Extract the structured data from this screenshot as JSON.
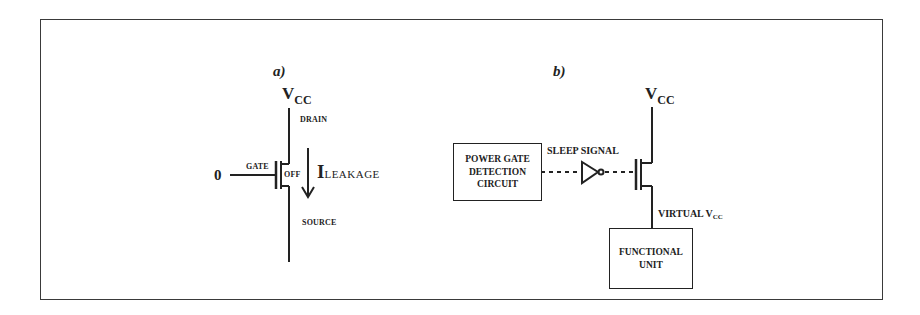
{
  "figure": {
    "panel_a": {
      "label": "a)",
      "supply": {
        "main": "V",
        "sub": "CC"
      },
      "drain_label": "DRAIN",
      "source_label": "SOURCE",
      "gate_label": "GATE",
      "state_label": "OFF",
      "input_value": "0",
      "current_label": {
        "main": "I",
        "sub": "LEAKAGE"
      }
    },
    "panel_b": {
      "label": "b)",
      "supply": {
        "main": "V",
        "sub": "CC"
      },
      "detection_box": {
        "line1": "POWER GATE",
        "line2": "DETECTION",
        "line3": "CIRCUIT"
      },
      "signal_label": "SLEEP SIGNAL",
      "virtual_label": {
        "main": "VIRTUAL V",
        "sub": "CC"
      },
      "functional_box": {
        "line1": "FUNCTIONAL",
        "line2": "UNIT"
      }
    },
    "colors": {
      "line": "#222222",
      "frame": "#3a3a3a",
      "background": "#ffffff"
    }
  }
}
